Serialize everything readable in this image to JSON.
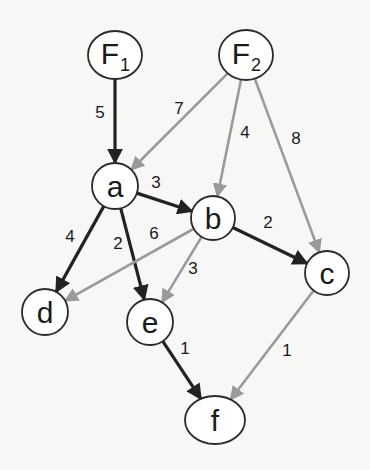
{
  "colors": {
    "dark_edge": "#222222",
    "gray_edge": "#9a9a9a",
    "node_fill": "#ffffff",
    "node_stroke": "#2a2a2a",
    "background": "#f7f7f5"
  },
  "nodes": [
    {
      "id": "F1",
      "label": "F",
      "sub": "1",
      "cx": 115,
      "cy": 55,
      "rx": 27,
      "ry": 24
    },
    {
      "id": "F2",
      "label": "F",
      "sub": "2",
      "cx": 246,
      "cy": 55,
      "rx": 27,
      "ry": 25
    },
    {
      "id": "a",
      "label": "a",
      "sub": "",
      "cx": 115,
      "cy": 186,
      "rx": 23,
      "ry": 23
    },
    {
      "id": "b",
      "label": "b",
      "sub": "",
      "cx": 213,
      "cy": 218,
      "rx": 22,
      "ry": 22
    },
    {
      "id": "c",
      "label": "c",
      "sub": "",
      "cx": 327,
      "cy": 273,
      "rx": 22,
      "ry": 22
    },
    {
      "id": "d",
      "label": "d",
      "sub": "",
      "cx": 45,
      "cy": 312,
      "rx": 23,
      "ry": 23
    },
    {
      "id": "e",
      "label": "e",
      "sub": "",
      "cx": 150,
      "cy": 322,
      "rx": 23,
      "ry": 23
    },
    {
      "id": "f",
      "label": "f",
      "sub": "",
      "cx": 215,
      "cy": 420,
      "rx": 30,
      "ry": 24
    }
  ],
  "edges": [
    {
      "from": "F1",
      "to": "a",
      "weight": "5",
      "style": "dark",
      "label_x": 100,
      "label_y": 112
    },
    {
      "from": "F2",
      "to": "a",
      "weight": "7",
      "style": "gray",
      "label_x": 179,
      "label_y": 108
    },
    {
      "from": "F2",
      "to": "b",
      "weight": "4",
      "style": "gray",
      "label_x": 245,
      "label_y": 132
    },
    {
      "from": "F2",
      "to": "c",
      "weight": "8",
      "style": "gray",
      "label_x": 296,
      "label_y": 138
    },
    {
      "from": "a",
      "to": "b",
      "weight": "3",
      "style": "dark",
      "label_x": 156,
      "label_y": 182
    },
    {
      "from": "a",
      "to": "d",
      "weight": "4",
      "style": "dark",
      "label_x": 70,
      "label_y": 236
    },
    {
      "from": "a",
      "to": "e",
      "weight": "2",
      "style": "dark",
      "label_x": 118,
      "label_y": 243
    },
    {
      "from": "b",
      "to": "d",
      "weight": "6",
      "style": "gray",
      "label_x": 154,
      "label_y": 233
    },
    {
      "from": "b",
      "to": "e",
      "weight": "3",
      "style": "gray",
      "label_x": 193,
      "label_y": 268
    },
    {
      "from": "b",
      "to": "c",
      "weight": "2",
      "style": "dark",
      "label_x": 268,
      "label_y": 222
    },
    {
      "from": "e",
      "to": "f",
      "weight": "1",
      "style": "dark",
      "label_x": 185,
      "label_y": 348
    },
    {
      "from": "c",
      "to": "f",
      "weight": "1",
      "style": "gray",
      "label_x": 287,
      "label_y": 350
    }
  ]
}
